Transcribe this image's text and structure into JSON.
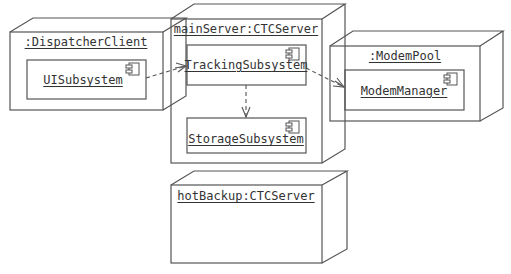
{
  "diagram": {
    "type": "UML deployment diagram",
    "colors": {
      "line": "#555555",
      "text": "#333333",
      "background": "#ffffff"
    },
    "nodes": [
      {
        "id": "dispatcher",
        "label": ":DispatcherClient"
      },
      {
        "id": "mainServer",
        "label": "mainServer:CTCServer"
      },
      {
        "id": "modemPool",
        "label": ":ModemPool"
      },
      {
        "id": "hotBackup",
        "label": "hotBackup:CTCServer"
      }
    ],
    "components": [
      {
        "id": "ui",
        "label": "UISubsystem",
        "node": "dispatcher"
      },
      {
        "id": "tracking",
        "label": "TrackingSubsystem",
        "node": "mainServer"
      },
      {
        "id": "storage",
        "label": "StorageSubsystem",
        "node": "mainServer"
      },
      {
        "id": "modemManager",
        "label": "ModemManager",
        "node": "modemPool"
      }
    ],
    "dependencies": [
      {
        "from": "UISubsystem",
        "to": "TrackingSubsystem",
        "style": "dashed-open-arrow"
      },
      {
        "from": "TrackingSubsystem",
        "to": "StorageSubsystem",
        "style": "dashed-open-arrow"
      },
      {
        "from": "TrackingSubsystem",
        "to": "ModemManager",
        "style": "dashed-open-arrow"
      }
    ]
  }
}
